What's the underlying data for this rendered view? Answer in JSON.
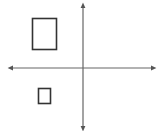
{
  "diagram": {
    "type": "coordinate-plane",
    "background": "#ffffff",
    "stroke_color": "#555555",
    "shape_color": "#333333",
    "axes": {
      "origin": {
        "x": 83,
        "y": 68
      },
      "horizontal": {
        "x1": 10,
        "x2": 154,
        "y": 68,
        "arrows": "both"
      },
      "vertical": {
        "x": 83,
        "y1": 5,
        "y2": 129,
        "arrows": "both"
      }
    },
    "shapes": [
      {
        "name": "large-rectangle",
        "quadrant": "II",
        "x": 32.5,
        "y": 18.5,
        "width": 24,
        "height": 31
      },
      {
        "name": "small-rectangle",
        "quadrant": "III",
        "x": 38.5,
        "y": 88.5,
        "width": 12,
        "height": 15
      }
    ]
  }
}
